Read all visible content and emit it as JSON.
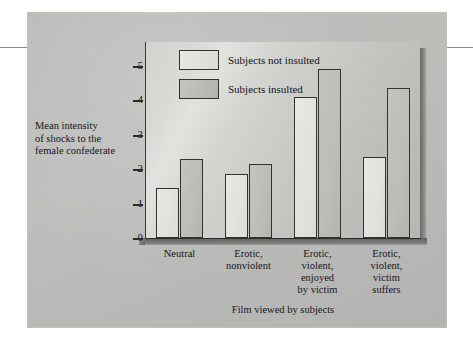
{
  "figure": {
    "background_color": "#bdbdba",
    "panel_color": "#d4d4d1"
  },
  "legend": {
    "position": "top-left-inside",
    "entries": [
      {
        "label": "Subjects not insulted",
        "swatch_color": "#e5e5e0"
      },
      {
        "label": "Subjects insulted",
        "swatch_color": "#bfbfba"
      }
    ]
  },
  "axes": {
    "y_title": "Mean intensity\nof shocks to the\nfemale confederate",
    "y_title_lines": [
      "Mean intensity",
      "of shocks to the",
      "female confederate"
    ],
    "x_title": "Film viewed by subjects",
    "y_ticks": [
      "0",
      "1",
      "2",
      "3",
      "4",
      "5"
    ]
  },
  "chart_data": {
    "type": "bar",
    "title": "",
    "xlabel": "Film viewed by subjects",
    "ylabel": "Mean intensity of shocks to the female confederate",
    "ylim": [
      0,
      5
    ],
    "yticks": [
      0,
      1,
      2,
      3,
      4,
      5
    ],
    "grid": false,
    "legend_position": "upper left",
    "categories": [
      "Neutral",
      "Erotic,\nnonviolent",
      "Erotic,\nviolent,\nenjoyed\nby victim",
      "Erotic,\nviolent,\nvictim\nsuffers"
    ],
    "category_lines": [
      [
        "Neutral"
      ],
      [
        "Erotic,",
        "nonviolent"
      ],
      [
        "Erotic,",
        "violent,",
        "enjoyed",
        "by victim"
      ],
      [
        "Erotic,",
        "violent,",
        "victim",
        "suffers"
      ]
    ],
    "series": [
      {
        "name": "Subjects not insulted",
        "color": "#e5e5e0",
        "values": [
          1.45,
          1.85,
          4.1,
          2.35
        ]
      },
      {
        "name": "Subjects insulted",
        "color": "#bfbfba",
        "values": [
          2.3,
          2.15,
          4.9,
          4.35
        ]
      }
    ]
  }
}
